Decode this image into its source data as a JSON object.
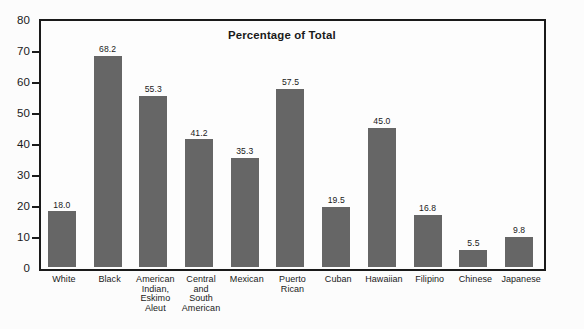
{
  "chart_data": {
    "type": "bar",
    "title": "Percentage of Total",
    "xlabel": "",
    "ylabel": "",
    "ylim": [
      0,
      80
    ],
    "ytick_step": 10,
    "yticks": [
      0,
      10,
      20,
      30,
      40,
      50,
      60,
      70,
      80
    ],
    "grid": false,
    "legend": null,
    "bar_color": "#666666",
    "axis_color": "#1a1a1a",
    "background_color": "#fcfcfc",
    "value_labels_shown": true,
    "categories": [
      "White",
      "Black",
      "American Indian, Eskimo Aleut",
      "Central and South American",
      "Mexican",
      "Puerto Rican",
      "Cuban",
      "Hawaiian",
      "Filipino",
      "Chinese",
      "Japanese"
    ],
    "category_lines": [
      [
        "White"
      ],
      [
        "Black"
      ],
      [
        "American",
        "Indian,",
        "Eskimo",
        "Aleut"
      ],
      [
        "Central",
        "and",
        "South",
        "American"
      ],
      [
        "Mexican"
      ],
      [
        "Puerto",
        "Rican"
      ],
      [
        "Cuban"
      ],
      [
        "Hawaiian"
      ],
      [
        "Filipino"
      ],
      [
        "Chinese"
      ],
      [
        "Japanese"
      ]
    ],
    "values": [
      18.0,
      68.2,
      55.3,
      41.2,
      35.3,
      57.5,
      19.5,
      45.0,
      16.8,
      5.5,
      9.8
    ],
    "value_labels": [
      "18.0",
      "68.2",
      "55.3",
      "41.2",
      "35.3",
      "57.5",
      "19.5",
      "45.0",
      "16.8",
      "5.5",
      "9.8"
    ]
  }
}
